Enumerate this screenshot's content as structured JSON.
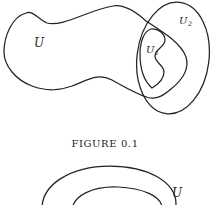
{
  "figure1": {
    "label_u": "U",
    "label_u1_base": "U",
    "label_u1_sub": "1",
    "label_u2_base": "U",
    "label_u2_sub": "2",
    "caption": "FIGURE 0.1"
  },
  "figure2": {
    "label_u": "U"
  },
  "colors": {
    "stroke": "#222222",
    "background": "#ffffff"
  }
}
